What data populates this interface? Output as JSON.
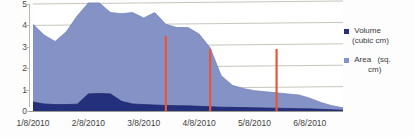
{
  "chart_data": {
    "type": "area",
    "title": "",
    "xlabel": "",
    "ylabel": "",
    "ylim": [
      0,
      5
    ],
    "y_ticks": [
      "0",
      "1",
      "2",
      "3",
      "4",
      "5"
    ],
    "grid": true,
    "stacked": false,
    "legend_position": "right",
    "x_tick_labels": [
      "1/8/2010",
      "2/8/2010",
      "3/8/2010",
      "4/8/2010",
      "5/8/2010",
      "6/8/2010"
    ],
    "x": [
      "1/8/2010",
      "1/14/2010",
      "1/20/2010",
      "1/26/2010",
      "2/1/2010",
      "2/8/2010",
      "2/14/2010",
      "2/20/2010",
      "2/26/2010",
      "3/1/2010",
      "3/8/2010",
      "3/14/2010",
      "3/20/2010",
      "3/26/2010",
      "4/1/2010",
      "4/8/2010",
      "4/14/2010",
      "4/20/2010",
      "4/26/2010",
      "5/1/2010",
      "5/8/2010",
      "5/14/2010",
      "5/20/2010",
      "5/26/2010",
      "6/1/2010",
      "6/8/2010",
      "6/14/2010",
      "6/20/2010",
      "6/26/2010"
    ],
    "series": [
      {
        "name": "Area (sq. cm)",
        "unit": "sq. cm",
        "color": "#8492c6",
        "values": [
          4.05,
          3.55,
          3.25,
          3.7,
          4.45,
          5.05,
          5.05,
          4.6,
          4.55,
          4.6,
          4.35,
          4.6,
          4.05,
          3.9,
          3.9,
          3.6,
          2.95,
          1.65,
          1.2,
          1.05,
          0.95,
          0.9,
          0.85,
          0.8,
          0.75,
          0.6,
          0.4,
          0.25,
          0.15
        ]
      },
      {
        "name": "Volume (cubic cm)",
        "unit": "cubic cm",
        "color": "#25307d",
        "values": [
          0.42,
          0.33,
          0.3,
          0.3,
          0.32,
          0.8,
          0.82,
          0.8,
          0.45,
          0.33,
          0.3,
          0.28,
          0.26,
          0.25,
          0.24,
          0.22,
          0.2,
          0.18,
          0.17,
          0.16,
          0.15,
          0.14,
          0.13,
          0.12,
          0.11,
          0.1,
          0.08,
          0.06,
          0.04
        ]
      }
    ],
    "markers": [
      {
        "label": "3/8/2010",
        "x_value": "3/20/2010",
        "color": "#e8553a",
        "top": 0.3,
        "bottom": 1.0
      },
      {
        "label": "4/8/2010",
        "x_value": "4/14/2010",
        "color": "#e8553a",
        "top": 0.42,
        "bottom": 1.0
      },
      {
        "label": "5/8/2010",
        "x_value": "5/20/2010",
        "color": "#e8553a",
        "top": 0.42,
        "bottom": 1.0
      }
    ],
    "legend": [
      {
        "label": "Volume",
        "unit": "(cubic cm)",
        "color": "#25307d"
      },
      {
        "label": "Area",
        "unit": "(sq.",
        "unit2": "cm)",
        "color": "#8492c6"
      }
    ]
  }
}
